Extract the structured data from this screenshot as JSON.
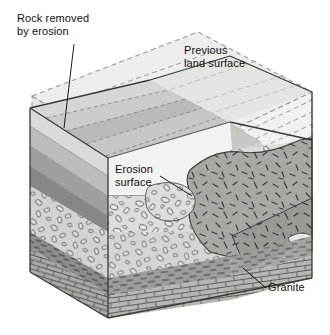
{
  "figure": {
    "type": "geologic-block-diagram",
    "width": 330,
    "height": 335,
    "background": "#ffffff"
  },
  "labels": {
    "rock_removed": "Rock removed\nby erosion",
    "previous_land_surface": "Previous\nland surface",
    "erosion_surface": "Erosion\nsurface",
    "granite": "Granite"
  },
  "callouts": [
    {
      "name": "rock-removed-leader",
      "label": "Rock removed by erosion",
      "from": [
        74,
        44
      ],
      "to": [
        64,
        128
      ]
    },
    {
      "name": "erosion-surface-leader",
      "label": "Erosion surface",
      "from": [
        160,
        176
      ],
      "to": [
        192,
        196
      ]
    },
    {
      "name": "granite-leader",
      "label": "Granite",
      "from": [
        266,
        288
      ],
      "to": [
        243,
        268
      ]
    }
  ],
  "colors": {
    "ghost_fill": "#ececeb",
    "ghost_dash": "#9a9a98",
    "outline": "#3a3a3a",
    "band_light": "#e3e3e1",
    "band_mid": "#c6c6c3",
    "band_dark": "#a8a8a4",
    "band_darker": "#8e8e8a",
    "conglomerate": "#d7d7d3",
    "shale": "#9d9d98",
    "limestone": "#b4b4af",
    "granite": "#a6a6a1",
    "white_wedge": "#f4f4f2",
    "text": "#111111"
  },
  "units": [
    {
      "name": "previous-land-surface-ghost",
      "pattern": "dashed-outline",
      "description": "eroded-away tilted strata shown as ghost block"
    },
    {
      "name": "tilted-strata-bands",
      "pattern": "banded",
      "description": "tilted sedimentary layers truncated by erosion surface"
    },
    {
      "name": "erosion-surface",
      "pattern": "line",
      "description": "angular unconformity plane"
    },
    {
      "name": "conglomerate-layer",
      "pattern": "pebbles-ovals"
    },
    {
      "name": "shale-layer",
      "pattern": "dashes"
    },
    {
      "name": "limestone-layer",
      "pattern": "brick"
    },
    {
      "name": "granite-body",
      "pattern": "random-ticks",
      "description": "intrusive granite pluton"
    }
  ]
}
